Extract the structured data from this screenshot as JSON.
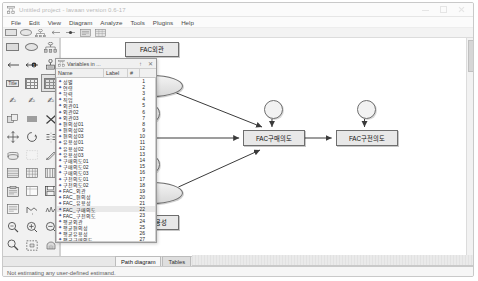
{
  "window": {
    "title": "Untitled project - lavaan version 0.6-17",
    "icon": "path-diagram-icon",
    "controls": {
      "minimize": "minimize-icon",
      "maximize": "maximize-icon",
      "close": "close-icon"
    }
  },
  "menubar": {
    "items": [
      {
        "label": "File"
      },
      {
        "label": "Edit"
      },
      {
        "label": "View"
      },
      {
        "label": "Diagram"
      },
      {
        "label": "Analyze"
      },
      {
        "label": "Tools"
      },
      {
        "label": "Plugins"
      },
      {
        "label": "Help"
      }
    ]
  },
  "toolstrip": {
    "items": [
      {
        "name": "observed-variable-tool",
        "glyph": "rect"
      },
      {
        "name": "latent-variable-tool",
        "glyph": "ellipse"
      },
      {
        "name": "indicator-tool",
        "glyph": "indicators"
      },
      {
        "name": "regression-path-tool",
        "glyph": "arrow"
      },
      {
        "name": "covariance-tool",
        "glyph": "covar"
      },
      {
        "name": "title-tool",
        "glyph": "title"
      },
      {
        "name": "matrix-tool",
        "glyph": "matrix"
      }
    ]
  },
  "palette": {
    "selected_index": 8,
    "items": [
      {
        "name": "draw-observed-variable",
        "glyph": "rect"
      },
      {
        "name": "draw-latent-variable",
        "glyph": "ellipse"
      },
      {
        "name": "draw-indicators",
        "glyph": "indicators"
      },
      {
        "name": "draw-single-headed-path",
        "glyph": "arrow-left"
      },
      {
        "name": "draw-double-headed-path",
        "glyph": "arrow-dot"
      },
      {
        "name": "draw-mean-intercept",
        "glyph": "mean"
      },
      {
        "name": "insert-title",
        "glyph": "title-label"
      },
      {
        "name": "list-variables",
        "glyph": "grid"
      },
      {
        "name": "variables-in-dataset",
        "glyph": "grid-selected"
      },
      {
        "name": "select-all-objects",
        "glyph": "hand-all"
      },
      {
        "name": "select-one-object",
        "glyph": "hand-one"
      },
      {
        "name": "deselect-objects",
        "glyph": "hand-deselect"
      },
      {
        "name": "duplicate-objects",
        "glyph": "duplicate"
      },
      {
        "name": "move-objects",
        "glyph": "move-parallel"
      },
      {
        "name": "erase-objects",
        "glyph": "erase-x"
      },
      {
        "name": "move-parameter",
        "glyph": "move-arrows"
      },
      {
        "name": "rotate-indicators",
        "glyph": "rotate"
      },
      {
        "name": "reflect-indicators",
        "glyph": "reflect"
      },
      {
        "name": "shape-change",
        "glyph": "shape"
      },
      {
        "name": "resize-diagram",
        "glyph": "resize"
      },
      {
        "name": "pen-tool",
        "glyph": "pen"
      },
      {
        "name": "preserve-symmetries",
        "glyph": "symmetry"
      },
      {
        "name": "drag-properties",
        "glyph": "drag-props"
      },
      {
        "name": "table-output",
        "glyph": "table"
      },
      {
        "name": "analysis-properties",
        "glyph": "analysis-props"
      },
      {
        "name": "data-file",
        "glyph": "data-file"
      },
      {
        "name": "save-diagram",
        "glyph": "save"
      },
      {
        "name": "text-output",
        "glyph": "text-output"
      },
      {
        "name": "degrees-of-freedom",
        "glyph": "df"
      },
      {
        "name": "multiple-groups",
        "glyph": "groups"
      },
      {
        "name": "zoom-in-region",
        "glyph": "zoom-region"
      },
      {
        "name": "zoom-in",
        "glyph": "zoom-plus"
      },
      {
        "name": "zoom-out",
        "glyph": "zoom-minus"
      },
      {
        "name": "magnify",
        "glyph": "magnifier"
      },
      {
        "name": "fit-to-page",
        "glyph": "fit-page"
      },
      {
        "name": "scroll-diagram",
        "glyph": "scroll-hand"
      },
      {
        "name": "bayesian-estimation",
        "glyph": "bayes"
      },
      {
        "name": "multiple-models",
        "glyph": "multi-models"
      },
      {
        "name": "print-diagram",
        "glyph": "print"
      },
      {
        "name": "undo",
        "glyph": "undo"
      },
      {
        "name": "redo",
        "glyph": "redo"
      },
      {
        "name": "object-properties",
        "glyph": "binoculars"
      }
    ]
  },
  "variables_window": {
    "title": "Variables in ...",
    "icon": "variables-icon",
    "pin_icon": "pin-icon",
    "close_icon": "close-icon",
    "columns": [
      {
        "label": "Name"
      },
      {
        "label": "Label"
      },
      {
        "label": "#"
      }
    ],
    "selected_row": 21,
    "rows": [
      {
        "name": "성별",
        "num": "1"
      },
      {
        "name": "연령",
        "num": "2"
      },
      {
        "name": "학력",
        "num": "3"
      },
      {
        "name": "직업",
        "num": "4"
      },
      {
        "name": "외관01",
        "num": "5"
      },
      {
        "name": "외관02",
        "num": "6"
      },
      {
        "name": "외관03",
        "num": "7"
      },
      {
        "name": "편의성01",
        "num": "8"
      },
      {
        "name": "편의성02",
        "num": "9"
      },
      {
        "name": "편의성03",
        "num": "10"
      },
      {
        "name": "유용성01",
        "num": "11"
      },
      {
        "name": "유용성02",
        "num": "12"
      },
      {
        "name": "유용성03",
        "num": "13"
      },
      {
        "name": "구매의도01",
        "num": "14"
      },
      {
        "name": "구매의도02",
        "num": "15"
      },
      {
        "name": "구매의도03",
        "num": "16"
      },
      {
        "name": "구전의도01",
        "num": "17"
      },
      {
        "name": "구전의도02",
        "num": "18"
      },
      {
        "name": "FAC_외관",
        "num": "19"
      },
      {
        "name": "FAC_편의성",
        "num": "20"
      },
      {
        "name": "FAC_유용성",
        "num": "21"
      },
      {
        "name": "FAC_구매의도",
        "num": "22"
      },
      {
        "name": "FAC_구전의도",
        "num": "23"
      },
      {
        "name": "평균외관",
        "num": "24"
      },
      {
        "name": "평균편의성",
        "num": "25"
      },
      {
        "name": "평균유용성",
        "num": "26"
      },
      {
        "name": "평균구매의도",
        "num": "27"
      },
      {
        "name": "평균구전의도",
        "num": "28"
      }
    ]
  },
  "diagram": {
    "nodes": [
      {
        "id": "fac_exterior",
        "name": "node-fac-exterior",
        "type": "box",
        "label": "FAC외관",
        "x": 64,
        "y": 4,
        "w": 54,
        "h": 15
      },
      {
        "id": "lat_top",
        "name": "latent-node-top",
        "type": "lat",
        "label": "",
        "x": 60,
        "y": 37,
        "w": 62,
        "h": 22
      },
      {
        "id": "err_top",
        "name": "error-node-top",
        "type": "err",
        "label": "",
        "x": 80,
        "y": 66,
        "w": 19,
        "h": 19
      },
      {
        "id": "fac_conv",
        "name": "node-fac-convenience",
        "type": "box",
        "label": "FAC편의성",
        "x": 0,
        "y": 92,
        "w": 58,
        "h": 16
      },
      {
        "id": "err_purchase",
        "name": "error-node-purchase",
        "type": "err",
        "label": "",
        "x": 203,
        "y": 62,
        "w": 19,
        "h": 19
      },
      {
        "id": "fac_purchase",
        "name": "node-fac-purchase",
        "type": "box",
        "label": "FAC구매의도",
        "x": 182,
        "y": 92,
        "w": 62,
        "h": 16
      },
      {
        "id": "err_wom",
        "name": "error-node-wom",
        "type": "err",
        "label": "",
        "x": 296,
        "y": 62,
        "w": 19,
        "h": 19
      },
      {
        "id": "fac_wom",
        "name": "node-fac-wom",
        "type": "box",
        "label": "FAC구전의도",
        "x": 275,
        "y": 92,
        "w": 62,
        "h": 16
      },
      {
        "id": "err_bottom",
        "name": "error-node-bottom",
        "type": "err",
        "label": "",
        "x": 80,
        "y": 117,
        "w": 19,
        "h": 19
      },
      {
        "id": "lat_bottom",
        "name": "latent-node-bottom",
        "type": "lat",
        "label": "",
        "x": 60,
        "y": 144,
        "w": 62,
        "h": 22
      },
      {
        "id": "fac_useful",
        "name": "node-fac-usefulness",
        "type": "box",
        "label": "FAC유용성",
        "x": 64,
        "y": 177,
        "w": 54,
        "h": 15
      }
    ],
    "edges": [
      {
        "name": "path-latent-top-to-exterior",
        "from": "lat_top",
        "to": "fac_exterior"
      },
      {
        "name": "path-latent-top-to-error",
        "from": "lat_top",
        "to": "err_top"
      },
      {
        "name": "path-convenience-to-latent-top",
        "from": "fac_conv",
        "to": "lat_top"
      },
      {
        "name": "path-latent-top-to-purchase",
        "from": "lat_top",
        "to": "fac_purchase"
      },
      {
        "name": "path-convenience-to-purchase",
        "from": "fac_conv",
        "to": "fac_purchase"
      },
      {
        "name": "path-error-to-purchase",
        "from": "err_purchase",
        "to": "fac_purchase"
      },
      {
        "name": "path-purchase-to-wom",
        "from": "fac_purchase",
        "to": "fac_wom"
      },
      {
        "name": "path-error-to-wom",
        "from": "err_wom",
        "to": "fac_wom"
      },
      {
        "name": "path-convenience-to-latent-bottom",
        "from": "fac_conv",
        "to": "lat_bottom"
      },
      {
        "name": "path-error-bottom-to-latent",
        "from": "err_bottom",
        "to": "lat_bottom"
      },
      {
        "name": "path-latent-bottom-to-useful",
        "from": "lat_bottom",
        "to": "fac_useful"
      },
      {
        "name": "path-latent-bottom-to-purchase",
        "from": "lat_bottom",
        "to": "fac_purchase"
      }
    ]
  },
  "tabs": {
    "items": [
      {
        "label": "Path diagram",
        "active": true
      },
      {
        "label": "Tables",
        "active": false
      }
    ]
  },
  "statusbar": {
    "text": "Not estimating any user-defined estimand."
  }
}
